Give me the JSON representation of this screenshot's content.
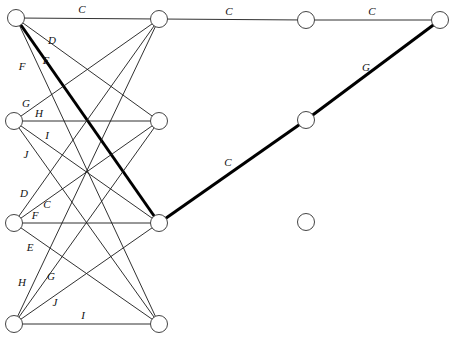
{
  "diagram": {
    "type": "graph",
    "node_radius": 8.5,
    "nodes": [
      {
        "id": "L1",
        "x": 16,
        "y": 18
      },
      {
        "id": "L2",
        "x": 14,
        "y": 121
      },
      {
        "id": "L3",
        "x": 14,
        "y": 223
      },
      {
        "id": "L4",
        "x": 14,
        "y": 324
      },
      {
        "id": "M1",
        "x": 159,
        "y": 19
      },
      {
        "id": "M2",
        "x": 159,
        "y": 121
      },
      {
        "id": "M3",
        "x": 159,
        "y": 223
      },
      {
        "id": "M4",
        "x": 159,
        "y": 324
      },
      {
        "id": "R1",
        "x": 306,
        "y": 20
      },
      {
        "id": "R2",
        "x": 306,
        "y": 120
      },
      {
        "id": "R3",
        "x": 306,
        "y": 222
      },
      {
        "id": "F1",
        "x": 440,
        "y": 20
      }
    ],
    "edges": [
      {
        "from": "L1",
        "to": "M1",
        "label": "C",
        "bold": false,
        "lx": 82,
        "ly": 13
      },
      {
        "from": "L1",
        "to": "M2",
        "label": "D",
        "bold": false,
        "lx": 52,
        "ly": 44
      },
      {
        "from": "L1",
        "to": "M3",
        "label": "E",
        "bold": true,
        "lx": 46,
        "ly": 64
      },
      {
        "from": "L1",
        "to": "M4",
        "label": "F",
        "bold": false,
        "lx": 22,
        "ly": 70
      },
      {
        "from": "L2",
        "to": "M1",
        "label": "G",
        "bold": false,
        "lx": 26,
        "ly": 107
      },
      {
        "from": "L2",
        "to": "M2",
        "label": "H",
        "bold": false,
        "lx": 39,
        "ly": 117
      },
      {
        "from": "L2",
        "to": "M3",
        "label": "I",
        "bold": false,
        "lx": 47,
        "ly": 139
      },
      {
        "from": "L2",
        "to": "M4",
        "label": "J",
        "bold": false,
        "lx": 26,
        "ly": 158
      },
      {
        "from": "L3",
        "to": "M1",
        "label": "D",
        "bold": false,
        "lx": 24,
        "ly": 197
      },
      {
        "from": "L3",
        "to": "M2",
        "label": "C",
        "bold": false,
        "lx": 47,
        "ly": 208
      },
      {
        "from": "L3",
        "to": "M3",
        "label": "F",
        "bold": false,
        "lx": 35,
        "ly": 219
      },
      {
        "from": "L3",
        "to": "M4",
        "label": "E",
        "bold": false,
        "lx": 30,
        "ly": 251
      },
      {
        "from": "L4",
        "to": "M1",
        "label": "H",
        "bold": false,
        "lx": 22,
        "ly": 286
      },
      {
        "from": "L4",
        "to": "M2",
        "label": "G",
        "bold": false,
        "lx": 51,
        "ly": 280
      },
      {
        "from": "L4",
        "to": "M3",
        "label": "J",
        "bold": false,
        "lx": 55,
        "ly": 306
      },
      {
        "from": "L4",
        "to": "M4",
        "label": "I",
        "bold": false,
        "lx": 83,
        "ly": 319
      },
      {
        "from": "M1",
        "to": "R1",
        "label": "C",
        "bold": false,
        "lx": 229,
        "ly": 15
      },
      {
        "from": "R1",
        "to": "F1",
        "label": "C",
        "bold": false,
        "lx": 372,
        "ly": 15
      },
      {
        "from": "M3",
        "to": "R2",
        "label": "C",
        "bold": true,
        "lx": 228,
        "ly": 166
      },
      {
        "from": "R2",
        "to": "F1",
        "label": "G",
        "bold": true,
        "lx": 366,
        "ly": 71
      }
    ]
  }
}
